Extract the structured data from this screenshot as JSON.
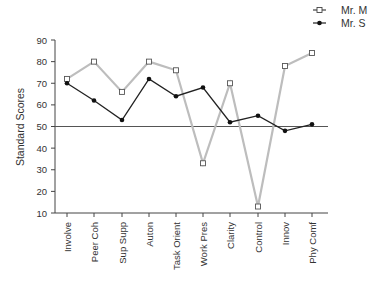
{
  "chart_data": {
    "type": "line",
    "title": "",
    "xlabel": "",
    "ylabel": "Standard Scores",
    "ylim": [
      10,
      90
    ],
    "yticks": [
      10,
      20,
      30,
      40,
      50,
      60,
      70,
      80,
      90
    ],
    "categories": [
      "Involve",
      "Peer Coh",
      "Sup Supp",
      "Auton",
      "Task Orient",
      "Work Pres",
      "Clarity",
      "Control",
      "Innov",
      "Phy Comf"
    ],
    "series": [
      {
        "name": "Mr. M",
        "marker": "open-square",
        "color": "#bdbdbd",
        "values": [
          72,
          80,
          66,
          80,
          76,
          33,
          70,
          13,
          78,
          84
        ]
      },
      {
        "name": "Mr. S",
        "marker": "filled-circle",
        "color": "#222222",
        "values": [
          70,
          62,
          53,
          72,
          64,
          68,
          52,
          55,
          48,
          51
        ]
      }
    ],
    "reference_line": {
      "y": 50,
      "color": "#555555"
    },
    "grid": false,
    "legend_position": "top-right"
  },
  "legend": {
    "items": [
      {
        "label": "Mr. M"
      },
      {
        "label": "Mr. S"
      }
    ]
  }
}
